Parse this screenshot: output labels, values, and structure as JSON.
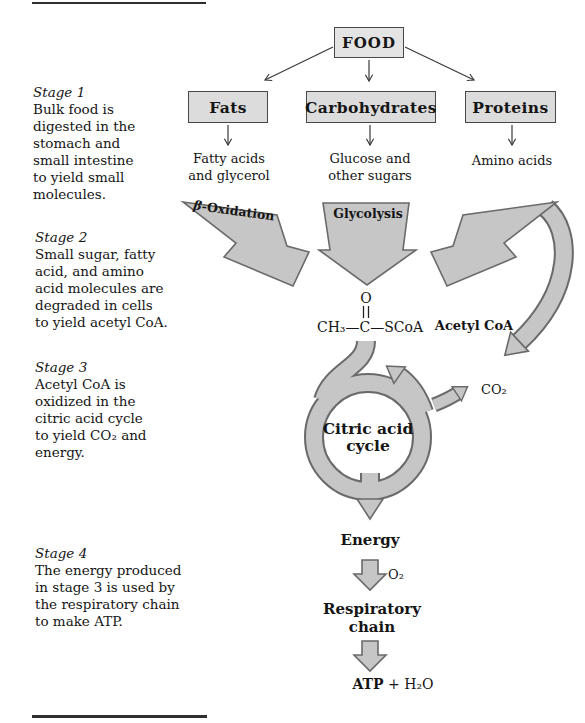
{
  "stages": [
    {
      "label": "Stage 1",
      "text": "Bulk food is\ndigested in the\nstomach and\nsmall intestine\nto yield small\nmolecules."
    },
    {
      "label": "Stage 2",
      "text": "Small sugar, fatty\nacid, and  amino\nacid molecules are\ndegraded in cells\nto yield acetyl CoA."
    },
    {
      "label": "Stage 3",
      "text": "Acetyl CoA is\noxidized in the\ncitric acid cycle\nto yield CO₂ and\nenergy."
    },
    {
      "label": "Stage 4",
      "text": "The energy produced\nin stage 3 is used by\nthe respiratory chain\nto make ATP."
    }
  ],
  "boxes": {
    "food": "FOOD",
    "fats": "Fats",
    "carbohydrates": "Carbohydrates",
    "proteins": "Proteins"
  },
  "products": {
    "fats": "Fatty acids\nand glycerol",
    "carbohydrates": "Glucose and\nother sugars",
    "proteins": "Amino acids"
  },
  "pathways": {
    "beta_symbol": "β",
    "beta_rest": "-Oxidation",
    "glycolysis": "Glycolysis",
    "acetyl_coa": "Acetyl CoA"
  },
  "acetyl_structure": {
    "oxygen": "O",
    "formula": "CH₃—C—SCoA"
  },
  "cycle": {
    "name": "Citric acid\ncycle",
    "co2": "CO₂"
  },
  "energy_section": {
    "energy": "Energy",
    "o2": "O₂",
    "respiratory": "Respiratory\nchain",
    "atp": "ATP",
    "water": " + H₂O"
  },
  "colors": {
    "arrow_fill": "#c6c6c6",
    "arrow_outline": "#6a6a6a",
    "box_fill": "#dcdcdc",
    "line": "#3a3a3a",
    "text": "#151515"
  }
}
